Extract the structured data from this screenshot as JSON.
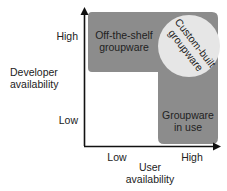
{
  "diagram": {
    "y_axis": {
      "title_line1": "Developer",
      "title_line2": "availability",
      "tick_high": "High",
      "tick_low": "Low"
    },
    "x_axis": {
      "title_line1": "User",
      "title_line2": "availability",
      "tick_low": "Low",
      "tick_high": "High"
    },
    "regions": {
      "off_the_shelf_line1": "Off-the-shelf",
      "off_the_shelf_line2": "groupware",
      "custom_built_line1": "Custom-built",
      "custom_built_line2": "groupware",
      "in_use_line1": "Groupware",
      "in_use_line2": "in use"
    },
    "colors": {
      "region_fill": "#8c8c8c",
      "circle_fill": "#e6e6e6",
      "axis": "#111111"
    }
  }
}
